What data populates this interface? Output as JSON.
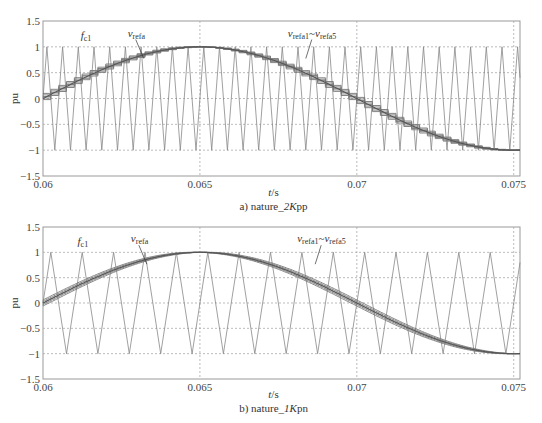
{
  "chart_data": [
    {
      "type": "line",
      "title": "a) nature_2Kpp",
      "caption_prefix": "a) nature_",
      "caption_italic": "2K",
      "caption_suffix": "pp",
      "xlabel": "t/s",
      "ylabel": "pu",
      "xlim": [
        0.06,
        0.0752
      ],
      "ylim": [
        -1.5,
        1.5
      ],
      "xticks": [
        0.06,
        0.065,
        0.07,
        0.075
      ],
      "xtick_labels": [
        "0.06",
        "0.065",
        "0.07",
        "0.075"
      ],
      "yticks": [
        -1.5,
        -1,
        -0.5,
        0,
        0.5,
        1,
        1.5
      ],
      "ytick_labels": [
        "−1.5",
        "−1",
        "−0.5",
        "0",
        "0.5",
        "1",
        "1.5"
      ],
      "grid": true,
      "series": [
        {
          "name": "fc1",
          "kind": "triangle carrier",
          "amplitude": 1,
          "period_s": 0.0005,
          "color": "#888888"
        },
        {
          "name": "vrefa",
          "kind": "sine",
          "amplitude": 1,
          "frequency_hz": 50,
          "phase_deg": 0,
          "t0": 0.06,
          "color": "#555555"
        },
        {
          "name": "vrefa1~vrefa5",
          "kind": "staircase sampled references",
          "steps_per_carrier": 1,
          "color": "#666666"
        }
      ],
      "annotations": [
        {
          "text": "fc1",
          "x": 0.0612,
          "y": 1.15
        },
        {
          "text": "vrefa",
          "x": 0.0627,
          "y": 1.2
        },
        {
          "text": "vrefa1~vrefa5",
          "x": 0.0678,
          "y": 1.2
        }
      ]
    },
    {
      "type": "line",
      "title": "b) nature_1Kpn",
      "caption_prefix": "b) nature_",
      "caption_italic": "1K",
      "caption_suffix": "pn",
      "xlabel": "t/s",
      "ylabel": "pu",
      "xlim": [
        0.06,
        0.0752
      ],
      "ylim": [
        -1.5,
        1.5
      ],
      "xticks": [
        0.06,
        0.065,
        0.07,
        0.075
      ],
      "xtick_labels": [
        "0.06",
        "0.065",
        "0.07",
        "0.075"
      ],
      "yticks": [
        -1.5,
        -1,
        -0.5,
        0,
        0.5,
        1,
        1.5
      ],
      "ytick_labels": [
        "−1.5",
        "−1",
        "−0.5",
        "0",
        "0.5",
        "1",
        "1.5"
      ],
      "grid": true,
      "series": [
        {
          "name": "fc1",
          "kind": "triangle carrier",
          "amplitude": 1,
          "period_s": 0.001,
          "color": "#888888"
        },
        {
          "name": "vrefa",
          "kind": "sine",
          "amplitude": 1,
          "frequency_hz": 50,
          "phase_deg": 0,
          "t0": 0.06,
          "color": "#555555"
        },
        {
          "name": "vrefa1~vrefa5",
          "kind": "band of shifted references",
          "band_width_pu": 0.12,
          "color": "#666666"
        }
      ],
      "annotations": [
        {
          "text": "fc1",
          "x": 0.0611,
          "y": 1.15
        },
        {
          "text": "vrefa",
          "x": 0.0628,
          "y": 1.2
        },
        {
          "text": "vrefa1~vrefa5",
          "x": 0.0681,
          "y": 1.2
        }
      ]
    }
  ],
  "labels": {
    "f": "f",
    "c1": "c1",
    "v": "v",
    "refa": "refa",
    "refa1": "refa1",
    "refa5": "refa5",
    "tilde": "~",
    "ylabel": "pu",
    "xlabel_t": "t",
    "xlabel_s": "/s"
  }
}
